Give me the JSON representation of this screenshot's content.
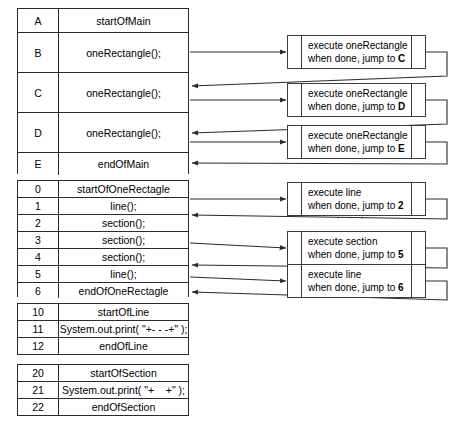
{
  "diagram": {
    "line_color": "#2b2b2b"
  },
  "main_table": {
    "name": "main",
    "rows": [
      {
        "label": "A",
        "code": "startOfMain"
      },
      {
        "label": "B",
        "code": "oneRectangle();"
      },
      {
        "label": "C",
        "code": "oneRectangle();"
      },
      {
        "label": "D",
        "code": "oneRectangle();"
      },
      {
        "label": "E",
        "code": "endOfMain"
      }
    ]
  },
  "one_rectangle_table": {
    "name": "oneRectangle",
    "rows": [
      {
        "label": "0",
        "code": "startOfOneRectagle"
      },
      {
        "label": "1",
        "code": "line();"
      },
      {
        "label": "2",
        "code": "section();"
      },
      {
        "label": "3",
        "code": "section();"
      },
      {
        "label": "4",
        "code": "section();"
      },
      {
        "label": "5",
        "code": "line();"
      },
      {
        "label": "6",
        "code": "endOfOneRectagle"
      }
    ]
  },
  "line_table": {
    "name": "line",
    "rows": [
      {
        "label": "10",
        "code": "startOfLine"
      },
      {
        "label": "11",
        "code": "System.out.print( \"+- - -+\" );"
      },
      {
        "label": "12",
        "code": "endOfLine"
      }
    ]
  },
  "section_table": {
    "name": "section",
    "rows": [
      {
        "label": "20",
        "code": "startOfSection"
      },
      {
        "label": "21",
        "code": "System.out.print( \"+    +\" );"
      },
      {
        "label": "22",
        "code": "endOfSection"
      }
    ]
  },
  "exec_boxes": {
    "main_calls": [
      {
        "line1": "execute oneRectangle",
        "line2_prefix": "when done, jump to ",
        "line2_target": "C"
      },
      {
        "line1": "execute oneRectangle",
        "line2_prefix": "when done, jump to ",
        "line2_target": "D"
      },
      {
        "line1": "execute oneRectangle",
        "line2_prefix": "when done, jump to ",
        "line2_target": "E"
      }
    ],
    "one_rectangle_calls": [
      {
        "line1": "execute line",
        "line2_prefix": "when done, jump to ",
        "line2_target": "2"
      },
      {
        "line1": "execute section",
        "line2_prefix": "when done, jump to ",
        "line2_target": "5"
      },
      {
        "line1": "execute line",
        "line2_prefix": "when done, jump to ",
        "line2_target": "6"
      }
    ],
    "ellipsis": "· · ·"
  }
}
